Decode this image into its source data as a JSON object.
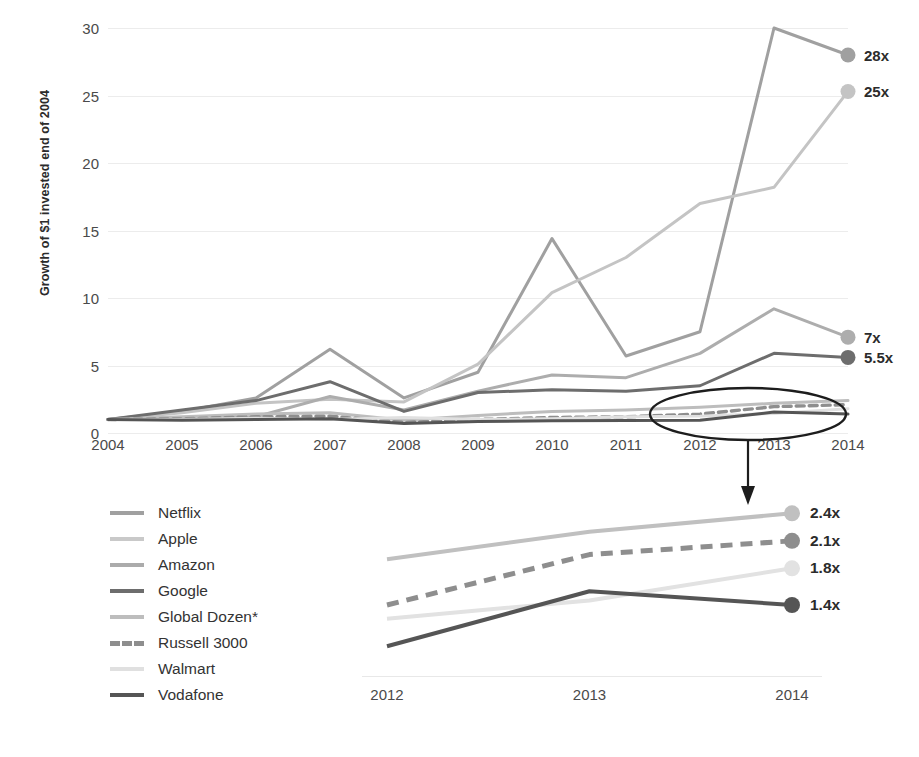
{
  "chart_data": {
    "type": "line",
    "title": "",
    "xlabel": "",
    "ylabel": "Growth of $1 invested end of 2004",
    "x": [
      2004,
      2005,
      2006,
      2007,
      2008,
      2009,
      2010,
      2011,
      2012,
      2013,
      2014
    ],
    "xlim": [
      2004,
      2014
    ],
    "ylim": [
      0,
      30
    ],
    "yticks": [
      0,
      5,
      10,
      15,
      20,
      25,
      30
    ],
    "ytick_labels": [
      "0",
      "5",
      "10",
      "15",
      "20",
      "25",
      "30"
    ],
    "xtick_labels": [
      "2004",
      "2005",
      "2006",
      "2007",
      "2008",
      "2009",
      "2010",
      "2011",
      "2012",
      "2013",
      "2014"
    ],
    "grid": true,
    "legend_position": "lower-left",
    "series": [
      {
        "name": "Netflix",
        "color": "#a0a0a0",
        "style": "solid",
        "end_label": "28x",
        "values": [
          1.0,
          1.6,
          2.6,
          6.2,
          2.6,
          4.5,
          14.4,
          5.7,
          7.5,
          30.0,
          28.0
        ]
      },
      {
        "name": "Apple",
        "color": "#c4c4c4",
        "style": "solid",
        "end_label": "25x",
        "values": [
          1.0,
          1.5,
          2.2,
          2.5,
          2.3,
          5.1,
          10.4,
          13.0,
          17.0,
          18.2,
          25.3
        ]
      },
      {
        "name": "Amazon",
        "color": "#adadad",
        "style": "solid",
        "end_label": "7x",
        "values": [
          1.0,
          1.1,
          1.2,
          2.7,
          1.7,
          3.1,
          4.3,
          4.1,
          5.9,
          9.2,
          7.1
        ]
      },
      {
        "name": "Google",
        "color": "#6d6d6d",
        "style": "solid",
        "end_label": "5.5x",
        "values": [
          1.0,
          1.7,
          2.4,
          3.8,
          1.6,
          3.0,
          3.2,
          3.1,
          3.5,
          5.9,
          5.6
        ]
      },
      {
        "name": "Global Dozen*",
        "color": "#bdbdbd",
        "style": "solid",
        "end_label": "",
        "values": [
          1.0,
          1.2,
          1.4,
          1.5,
          0.95,
          1.3,
          1.6,
          1.7,
          1.9,
          2.2,
          2.4
        ]
      },
      {
        "name": "Russell 3000",
        "color": "#8e8e8e",
        "style": "dashed",
        "end_label": "",
        "values": [
          1.0,
          1.05,
          1.2,
          1.25,
          0.78,
          1.0,
          1.15,
          1.2,
          1.4,
          1.95,
          2.1
        ]
      },
      {
        "name": "Walmart",
        "color": "#e0e0e0",
        "style": "solid",
        "end_label": "",
        "values": [
          1.0,
          1.0,
          1.1,
          1.0,
          1.15,
          1.0,
          1.05,
          1.2,
          1.25,
          1.45,
          1.8
        ]
      },
      {
        "name": "Vodafone",
        "color": "#555555",
        "style": "solid",
        "end_label": "",
        "values": [
          1.0,
          0.95,
          1.0,
          1.05,
          0.7,
          0.85,
          0.9,
          0.92,
          0.95,
          1.55,
          1.4
        ]
      }
    ],
    "end_labels": [
      {
        "label": "28x",
        "value": 28.0,
        "series": "Netflix"
      },
      {
        "label": "25x",
        "value": 25.3,
        "series": "Apple"
      },
      {
        "label": "7x",
        "value": 7.1,
        "series": "Amazon"
      },
      {
        "label": "5.5x",
        "value": 5.6,
        "series": "Google"
      }
    ],
    "annotations": [
      {
        "type": "ellipse",
        "label": "zoom-region",
        "x_range": [
          2011.6,
          2014.2
        ]
      },
      {
        "type": "arrow",
        "label": "points-to-inset"
      }
    ],
    "inset": {
      "type": "line",
      "x": [
        2012,
        2013,
        2014
      ],
      "xtick_labels": [
        "2012",
        "2013",
        "2014"
      ],
      "ylim": [
        0.8,
        2.6
      ],
      "series": [
        {
          "name": "Global Dozen*",
          "color": "#c0c0c0",
          "style": "solid",
          "values": [
            1.9,
            2.2,
            2.4
          ],
          "end_label": "2.4x"
        },
        {
          "name": "Russell 3000",
          "color": "#8e8e8e",
          "style": "dashed",
          "values": [
            1.4,
            1.95,
            2.1
          ],
          "end_label": "2.1x"
        },
        {
          "name": "Walmart",
          "color": "#e2e2e2",
          "style": "solid",
          "values": [
            1.25,
            1.45,
            1.8
          ],
          "end_label": "1.8x"
        },
        {
          "name": "Vodafone",
          "color": "#555555",
          "style": "solid",
          "values": [
            0.95,
            1.55,
            1.4
          ],
          "end_label": "1.4x"
        }
      ]
    }
  },
  "axis": {
    "y_title": "Growth of $1 invested end of 2004",
    "y_ticks": [
      "30",
      "25",
      "20",
      "15",
      "10",
      "5",
      "0"
    ],
    "x_ticks": [
      "2004",
      "2005",
      "2006",
      "2007",
      "2008",
      "2009",
      "2010",
      "2011",
      "2012",
      "2013",
      "2014"
    ]
  },
  "end_labels": {
    "netflix": "28x",
    "apple": "25x",
    "amazon": "7x",
    "google": "5.5x"
  },
  "legend": {
    "items": [
      {
        "label": "Netflix",
        "color": "#a0a0a0",
        "style": "solid"
      },
      {
        "label": "Apple",
        "color": "#c9c9c9",
        "style": "solid"
      },
      {
        "label": "Amazon",
        "color": "#ababab",
        "style": "solid"
      },
      {
        "label": "Google",
        "color": "#6d6d6d",
        "style": "solid"
      },
      {
        "label": "Global Dozen*",
        "color": "#bdbdbd",
        "style": "solid"
      },
      {
        "label": "Russell 3000",
        "color": "#8e8e8e",
        "style": "dashed"
      },
      {
        "label": "Walmart",
        "color": "#e0e0e0",
        "style": "solid"
      },
      {
        "label": "Vodafone",
        "color": "#555555",
        "style": "solid"
      }
    ]
  },
  "inset_labels": {
    "x_ticks": [
      "2012",
      "2013",
      "2014"
    ],
    "global_dozen": "2.4x",
    "russell": "2.1x",
    "walmart": "1.8x",
    "vodafone": "1.4x"
  }
}
